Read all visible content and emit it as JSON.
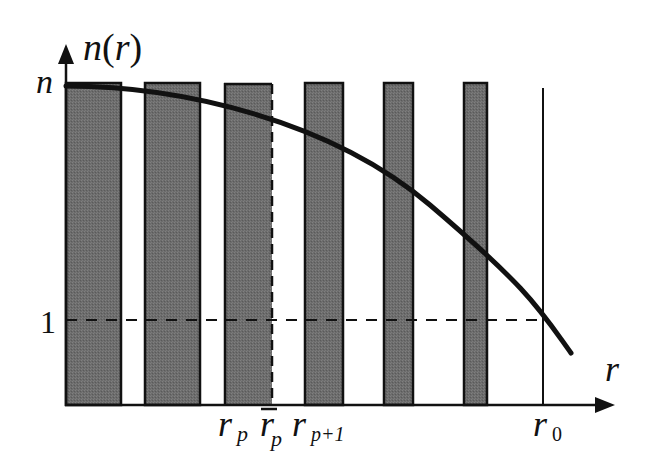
{
  "diagram": {
    "type": "refractive-index-profile",
    "y_axis": {
      "label": "n(r)",
      "ticks": [
        {
          "label": "n"
        },
        {
          "label": "1"
        }
      ]
    },
    "x_axis": {
      "label": "r"
    },
    "x_labels": {
      "r_p": {
        "base": "r",
        "sub": "p"
      },
      "r_bar_p": {
        "base": "r",
        "sub": "p",
        "overline": true
      },
      "r_p1": {
        "base": "r",
        "sub": "p+1"
      },
      "r_0": {
        "base": "r",
        "sub": "0"
      }
    },
    "bars": [
      {
        "x0": 66,
        "x1": 121
      },
      {
        "x0": 145,
        "x1": 200
      },
      {
        "x0": 225,
        "x1": 272,
        "right_edge": "dashed"
      },
      {
        "x0": 305,
        "x1": 343
      },
      {
        "x0": 384,
        "x1": 413
      },
      {
        "x0": 464,
        "x1": 487
      }
    ],
    "curve": "n(r) decreasing parabola-like from n at r=0 crossing 1 at r0",
    "colors": {
      "bar_fill": "#6e6e6e",
      "line": "#111111",
      "background": "#ffffff"
    }
  }
}
